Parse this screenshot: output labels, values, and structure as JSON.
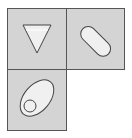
{
  "diagram": {
    "tiles": [
      {
        "id": "top-left",
        "shape": "inverted-triangle",
        "fill": "#f0f0f0",
        "background": "#d4d4d4"
      },
      {
        "id": "top-right",
        "shape": "diagonal-capsule",
        "fill": "#f0f0f0",
        "background": "#d4d4d4"
      },
      {
        "id": "bottom-left",
        "shape": "ellipse-with-circle",
        "fill": "#f0f0f0",
        "background": "#d4d4d4"
      }
    ],
    "stroke_color": "#444444"
  }
}
